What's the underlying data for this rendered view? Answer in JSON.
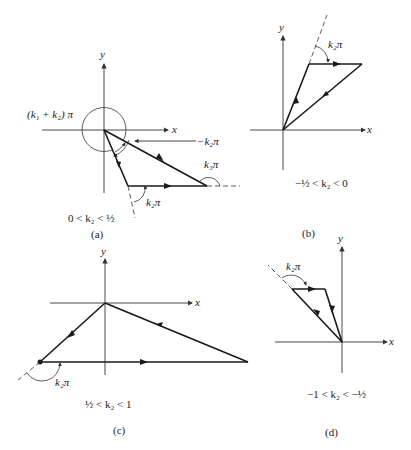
{
  "panels": [
    {
      "id": "a",
      "caption": "(a)",
      "condition": "0 < k₂ < ½",
      "axis_x": "x",
      "axis_y": "y",
      "labels": [
        "(k₁ + k₂) π",
        "−k₂π",
        "k₃π",
        "k₂π"
      ]
    },
    {
      "id": "b",
      "caption": "(b)",
      "condition": "−½ < k₂ < 0",
      "axis_x": "x",
      "axis_y": "y",
      "labels": [
        "k₂π"
      ]
    },
    {
      "id": "c",
      "caption": "(c)",
      "condition": "½ < k₂ < 1",
      "axis_x": "x",
      "axis_y": "y",
      "labels": [
        "k₂π"
      ]
    },
    {
      "id": "d",
      "caption": "(d)",
      "condition": "−1 < k₂ < −½",
      "axis_x": "x",
      "axis_y": "y",
      "labels": [
        "k₂π"
      ]
    }
  ]
}
